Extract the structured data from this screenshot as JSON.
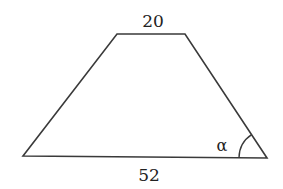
{
  "diagram": {
    "type": "trapezoid",
    "top_side_label": "20",
    "bottom_side_label": "52",
    "angle_label": "α",
    "vertices": {
      "top_left": [
        117,
        34
      ],
      "top_right": [
        185,
        34
      ],
      "bottom_right": [
        267,
        158
      ],
      "bottom_left": [
        23,
        156
      ]
    },
    "angle_marker": {
      "vertex": "bottom_right",
      "radius": 28
    },
    "colors": {
      "stroke": "#3a3a3a",
      "text": "#222222",
      "background": "#ffffff"
    }
  }
}
